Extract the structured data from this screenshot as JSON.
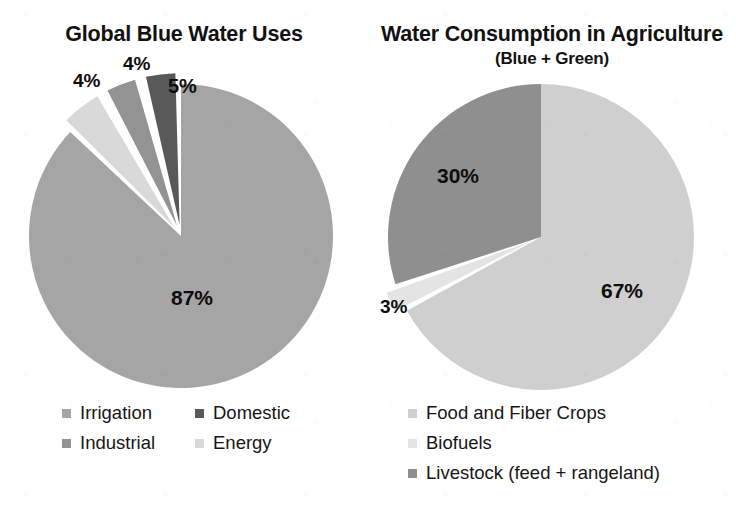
{
  "page": {
    "background": "#ffffff",
    "width": 736,
    "height": 525
  },
  "left_panel": {
    "title": "Global Blue Water Uses",
    "labels": {
      "irrigation": "87%",
      "energy": "5%",
      "industrial": "4%",
      "domestic": "4%"
    },
    "legend": [
      {
        "label": "Irrigation",
        "color": "#a5a5a5"
      },
      {
        "label": "Domestic",
        "color": "#595959"
      },
      {
        "label": "Industrial",
        "color": "#939393"
      },
      {
        "label": "Energy",
        "color": "#d9d9d9"
      }
    ]
  },
  "right_panel": {
    "title": "Water Consumption in Agriculture",
    "subtitle": "(Blue + Green)",
    "labels": {
      "food_and_fiber_crops": "67%",
      "livestock": "30%",
      "biofuels": "3%"
    },
    "legend": [
      {
        "label": "Food and Fiber Crops",
        "color": "#cfcfcf"
      },
      {
        "label": "Biofuels",
        "color": "#e4e4e4"
      },
      {
        "label": "Livestock (feed + rangeland)",
        "color": "#8f8f8f"
      }
    ]
  },
  "chart_data": [
    {
      "type": "pie",
      "id": "global-blue-water-uses",
      "title": "Global Blue Water Uses",
      "subtitle": "",
      "unit": "percent",
      "start_angle_deg": 0,
      "direction": "clockwise",
      "legend_position": "bottom",
      "categories": [
        "Irrigation",
        "Energy",
        "Industrial",
        "Domestic"
      ],
      "values": [
        87,
        5,
        4,
        4
      ],
      "labels": [
        "87%",
        "5%",
        "4%",
        "4%"
      ],
      "colors": [
        "#a5a5a5",
        "#d9d9d9",
        "#939393",
        "#595959"
      ],
      "exploded": [
        false,
        true,
        true,
        true
      ],
      "geometry": {
        "cx": 181,
        "cy": 236,
        "r": 152
      }
    },
    {
      "type": "pie",
      "id": "water-consumption-in-agriculture",
      "title": "Water Consumption in Agriculture",
      "subtitle": "(Blue + Green)",
      "unit": "percent",
      "start_angle_deg": 0,
      "direction": "clockwise",
      "legend_position": "bottom",
      "categories": [
        "Food and Fiber Crops",
        "Biofuels",
        "Livestock (feed + rangeland)"
      ],
      "values": [
        67,
        3,
        30
      ],
      "labels": [
        "67%",
        "3%",
        "30%"
      ],
      "colors": [
        "#cfcfcf",
        "#e4e4e4",
        "#8f8f8f"
      ],
      "exploded": [
        false,
        true,
        false
      ],
      "geometry": {
        "cx": 541,
        "cy": 237,
        "r": 153
      }
    }
  ]
}
